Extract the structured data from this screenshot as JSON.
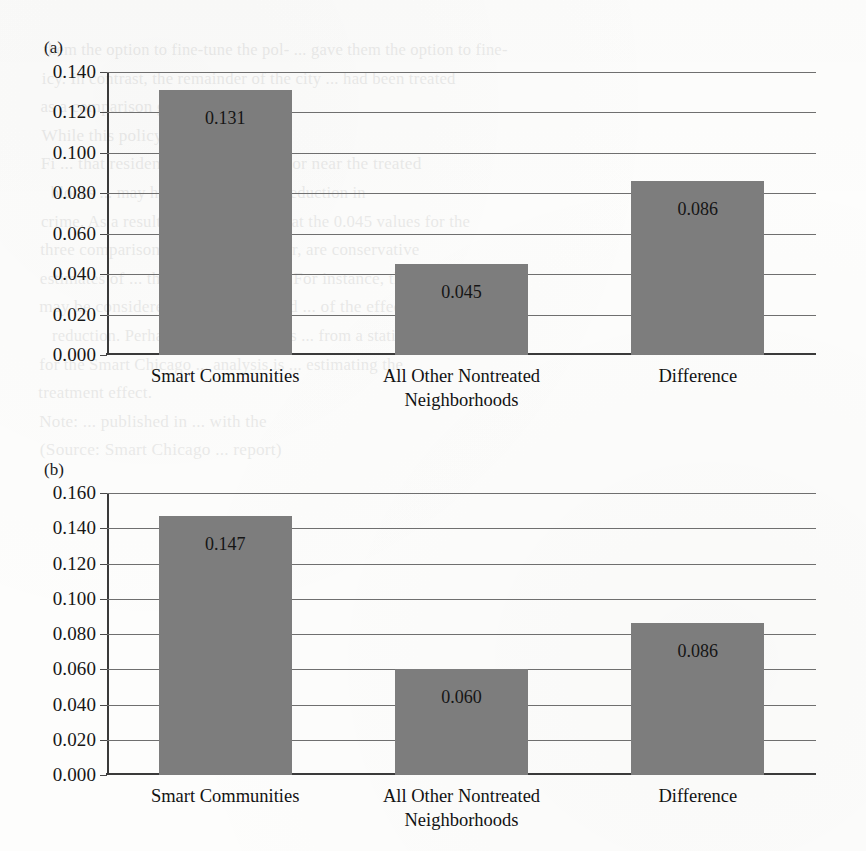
{
  "page": {
    "background_color": "#fdfdfc",
    "bar_color": "#7d7d7d",
    "axis_color": "#3a3a3a",
    "grid_color": "#6f6f6f",
    "ghost_text": [
      "them the option to fine-tune the pol-    ...   gave them the option to fine-",
      "icy. In contrast, the remainder of the city    ...   had been treated",
      "as a comparison group.",
      "While this policy was",
      "Fi   ...   that residents located directly or near the treated",
      "blocks     ...     may have experienced a reduction in",
      "crime. As a result, it is   ...   possible that the   0.045   values for the",
      "three comparison     ...     groups, however, are conservative",
      "estimates of   ...   the program impact. For instance, they",
      "may be considered as a lower bound   ...   of the effect of crime",
      "reduction. Perhaps, a point higher is   ...   from a statistical standpoint",
      "for the Smart Chicago   ...   analysis is   ...   estimating the",
      "treatment effect.",
      "Note:   ...   published in      ...     with the",
      "(Source: Smart Chicago   ...   report)"
    ]
  },
  "chart_data": [
    {
      "type": "bar",
      "panel": "(a)",
      "title": "",
      "xlabel": "",
      "ylabel": "",
      "categories": [
        "Smart Communities",
        "All Other Nontreated\nNeighborhoods",
        "Difference"
      ],
      "values": [
        0.131,
        0.045,
        0.086
      ],
      "value_labels": [
        "0.131",
        "0.045",
        "0.086"
      ],
      "ylim": [
        0.0,
        0.14
      ],
      "yticks": [
        0.0,
        0.02,
        0.04,
        0.06,
        0.08,
        0.1,
        0.12,
        0.14
      ],
      "ytick_labels": [
        "0.000",
        "0.020",
        "0.040",
        "0.060",
        "0.080",
        "0.100",
        "0.120",
        "0.140"
      ],
      "grid": true,
      "legend": "none"
    },
    {
      "type": "bar",
      "panel": "(b)",
      "title": "",
      "xlabel": "",
      "ylabel": "",
      "categories": [
        "Smart Communities",
        "All Other Nontreated\nNeighborhoods",
        "Difference"
      ],
      "values": [
        0.147,
        0.06,
        0.086
      ],
      "value_labels": [
        "0.147",
        "0.060",
        "0.086"
      ],
      "ylim": [
        0.0,
        0.16
      ],
      "yticks": [
        0.0,
        0.02,
        0.04,
        0.06,
        0.08,
        0.1,
        0.12,
        0.14,
        0.16
      ],
      "ytick_labels": [
        "0.000",
        "0.020",
        "0.040",
        "0.060",
        "0.080",
        "0.100",
        "0.120",
        "0.140",
        "0.160"
      ],
      "grid": true,
      "legend": "none"
    }
  ]
}
